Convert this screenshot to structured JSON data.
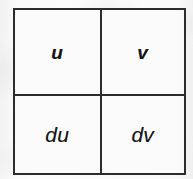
{
  "figure": {
    "kind": "2x2-grid-diagram",
    "colors": {
      "border": "#2c2c2c",
      "text": "#161616",
      "paper": "#fdfdfd",
      "cell_fill": "#fbfbfb"
    },
    "rows": [
      {
        "cells": [
          {
            "label": "u",
            "weight": "bold"
          },
          {
            "label": "v",
            "weight": "bold"
          }
        ]
      },
      {
        "cells": [
          {
            "label": "du",
            "weight": "normal"
          },
          {
            "label": "dv",
            "weight": "normal"
          }
        ]
      }
    ]
  }
}
